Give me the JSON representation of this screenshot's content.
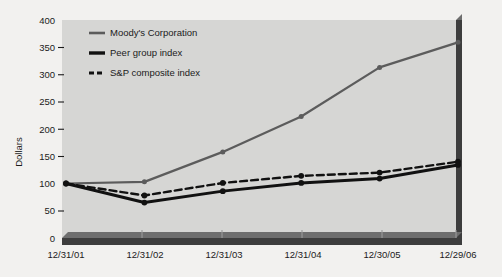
{
  "chart_data": {
    "type": "line",
    "title": "",
    "xlabel": "",
    "ylabel": "Dollars",
    "categories": [
      "12/31/01",
      "12/31/02",
      "12/31/03",
      "12/31/04",
      "12/30/05",
      "12/29/06"
    ],
    "ylim": [
      0,
      400
    ],
    "yticks": [
      0,
      50,
      100,
      150,
      200,
      250,
      300,
      350,
      400
    ],
    "ytick_labels": [
      "0",
      "50",
      "100",
      "150",
      "200",
      "250",
      "300",
      "350",
      "400"
    ],
    "grid": false,
    "legend_position": "top-left-inside",
    "series": [
      {
        "name": "Moody's Corporation",
        "values": [
          100,
          103,
          158,
          223,
          313,
          359
        ],
        "color": "#5c5c5c",
        "style": "solid",
        "width": 2.2,
        "markers": true
      },
      {
        "name": "Peer group index",
        "values": [
          100,
          65,
          86,
          101,
          109,
          134
        ],
        "color": "#111111",
        "style": "solid",
        "width": 3.0,
        "markers": true
      },
      {
        "name": "S&P composite index",
        "values": [
          100,
          78,
          101,
          114,
          120,
          140
        ],
        "color": "#111111",
        "style": "dashed",
        "width": 2.4,
        "markers": true
      }
    ]
  },
  "figure": {
    "plot_background": "#d6d6d4",
    "page_background": "#f2f1ef",
    "axis_bar_color": "#3d3d3d",
    "axis_bar_shadow": "#6e6e6e"
  }
}
